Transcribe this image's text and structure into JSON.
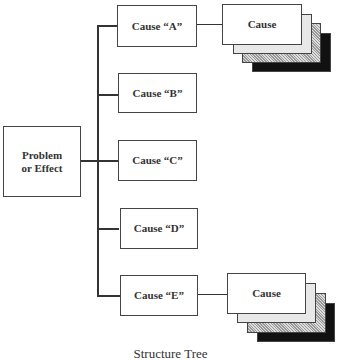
{
  "diagram": {
    "root": {
      "label": "Problem\nor Effect"
    },
    "causes": [
      {
        "label": "Cause “A”",
        "sub": "Cause"
      },
      {
        "label": "Cause “B”"
      },
      {
        "label": "Cause “C”"
      },
      {
        "label": "Cause “D”"
      },
      {
        "label": "Cause “E”",
        "sub": "Cause"
      }
    ],
    "caption": "Structure Tree"
  }
}
